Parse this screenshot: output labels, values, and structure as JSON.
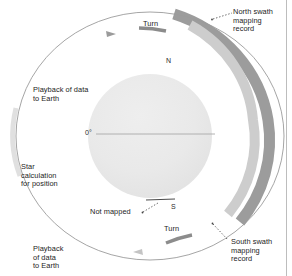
{
  "figure": {
    "type": "orbital-mapping-diagram",
    "background": "#ffffff",
    "border_color": "#b9b9b9"
  },
  "planet": {
    "name": "planet-sphere",
    "fill": "#e9e9e9",
    "center": [
      150,
      136
    ],
    "radius": 62,
    "equator_label": "0°",
    "north_pole_label": "N",
    "south_pole_label": "S"
  },
  "orbit": {
    "name": "spacecraft-orbit",
    "stroke": "#9a9a9a",
    "center": [
      150,
      136
    ],
    "rx": 133,
    "ry": 124
  },
  "swaths": [
    {
      "id": "north-swath",
      "label": "North swath\nmapping\nrecord",
      "color": "#9d9d9d"
    },
    {
      "id": "south-swath",
      "label": "South swath\nmapping\nrecord",
      "color": "#c9c9c9"
    }
  ],
  "labels": {
    "turn_top": "Turn",
    "turn_bottom": "Turn",
    "playback_top": "Playback of data\nto Earth",
    "playback_bottom": "Playback\nof data\nto Earth",
    "star_calculation": "Star\ncalculation\nfor position",
    "not_mapped": "Not mapped",
    "north_swath": "North swath\nmapping\nrecord",
    "south_swath": "South swath\nmapping\nrecord"
  },
  "colors": {
    "dark_arc": "#9c9c9c",
    "light_arc": "#cdcdcd",
    "planet": "#e9e9e9",
    "orbit_line": "#9b9b9b",
    "turn_segment": "#8c8c8c",
    "text": "#1d1d1d",
    "leader": "#555555",
    "frame": "#bdbdbd"
  }
}
